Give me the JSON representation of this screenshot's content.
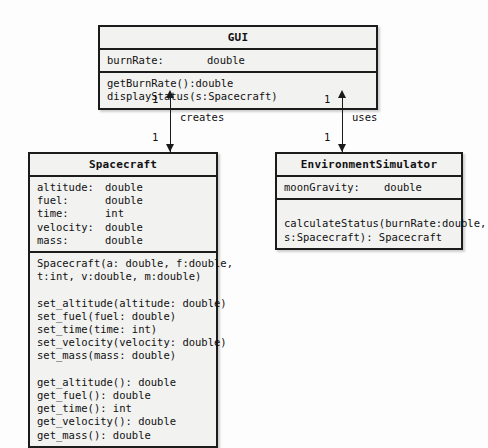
{
  "diagram": {
    "type": "uml-class-diagram",
    "background_color": "#fdfdfd",
    "box_fill_color": "#f2f2f0",
    "border_color": "#1c1c1c"
  },
  "classes": {
    "gui": {
      "name": "GUI",
      "attributes": [
        {
          "name": "burnRate:",
          "type": "double"
        }
      ],
      "methods": [
        "getBurnRate():double",
        "displayStatus(s:Spacecraft)"
      ]
    },
    "spacecraft": {
      "name": "Spacecraft",
      "attributes": [
        {
          "name": "altitude:",
          "type": "double"
        },
        {
          "name": "fuel:",
          "type": "double"
        },
        {
          "name": "time:",
          "type": "int"
        },
        {
          "name": "velocity:",
          "type": "double"
        },
        {
          "name": "mass:",
          "type": "double"
        }
      ],
      "constructor": [
        "Spacecraft(a: double, f:double,",
        "t:int, v:double, m:double)"
      ],
      "setters": [
        "set_altitude(altitude: double)",
        "set_fuel(fuel: double)",
        "set_time(time: int)",
        "set_velocity(velocity: double)",
        "set_mass(mass: double)"
      ],
      "getters": [
        "get_altitude(): double",
        "get_fuel(): double",
        "get_time(): int",
        "get_velocity(): double",
        "get_mass(): double"
      ]
    },
    "environment_simulator": {
      "name": "EnvironmentSimulator",
      "attributes": [
        {
          "name": "moonGravity:",
          "type": "double"
        }
      ],
      "methods": [
        "calculateStatus(burnRate:double,",
        "s:Spacecraft): Spacecraft"
      ]
    }
  },
  "relationships": {
    "creates": {
      "label": "creates",
      "source_multiplicity": "1",
      "target_multiplicity": "1"
    },
    "uses": {
      "label": "uses",
      "source_multiplicity": "1",
      "target_multiplicity": "1"
    }
  }
}
